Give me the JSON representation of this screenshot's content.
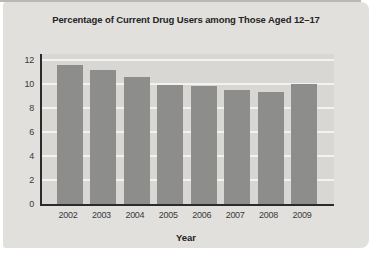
{
  "panel": {
    "bg_color": "#e1e0dd",
    "plot_bg_color": "#d8d7d4",
    "grid_color": "#f3f2ef",
    "axis_color": "#2b2b2b",
    "bar_color": "#8d8d8b",
    "text_color": "#242424"
  },
  "chart_data": {
    "type": "bar",
    "title": "Percentage of Current Drug Users among Those Aged 12–17",
    "xlabel": "Year",
    "ylabel": "",
    "categories": [
      "2002",
      "2003",
      "2004",
      "2005",
      "2006",
      "2007",
      "2008",
      "2009"
    ],
    "values": [
      11.6,
      11.2,
      10.6,
      9.9,
      9.8,
      9.5,
      9.3,
      10.0
    ],
    "yticks": [
      0,
      2,
      4,
      6,
      8,
      10,
      12
    ],
    "ylim": [
      0,
      12.5
    ],
    "grid": true,
    "legend": "none"
  }
}
